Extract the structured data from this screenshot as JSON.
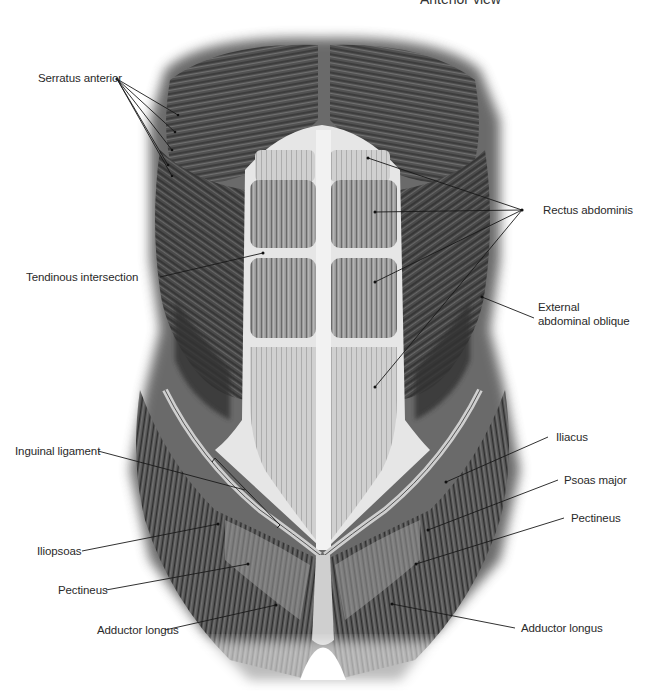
{
  "title": "Anterior view",
  "colors": {
    "background": "#ffffff",
    "label_text": "#2a2a2a",
    "leader_line": "#1a1a1a",
    "muscle_dark": "#3a3a3a",
    "muscle_mid": "#8a8a8a",
    "tendon_light": "#e8e8e8"
  },
  "labels": {
    "serratus_anterior": "Serratus anterior",
    "tendinous_intersection": "Tendinous intersection",
    "rectus_abdominis": "Rectus abdominis",
    "external_oblique_line1": "External",
    "external_oblique_line2": "abdominal oblique",
    "inguinal_ligament": "Inguinal ligament",
    "iliacus": "Iliacus",
    "psoas_major": "Psoas major",
    "pectineus_right": "Pectineus",
    "iliopsoas": "Iliopsoas",
    "pectineus_left": "Pectineus",
    "adductor_longus_left": "Adductor longus",
    "adductor_longus_right": "Adductor longus"
  }
}
